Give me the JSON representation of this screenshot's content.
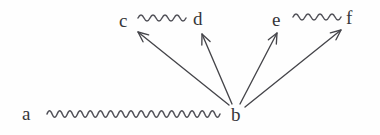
{
  "figure": {
    "type": "directed-graph-diagram",
    "width": 380,
    "height": 135,
    "background_color": "#fefefe",
    "ink_color": "#45454a",
    "label_color": "#36363a"
  },
  "nodes": [
    {
      "id": "a",
      "label": "a",
      "x": 22,
      "y": 104
    },
    {
      "id": "b",
      "label": "b",
      "x": 231,
      "y": 105
    },
    {
      "id": "c",
      "label": "c",
      "x": 119,
      "y": 11
    },
    {
      "id": "d",
      "label": "d",
      "x": 193,
      "y": 9
    },
    {
      "id": "e",
      "label": "e",
      "x": 272,
      "y": 10
    },
    {
      "id": "f",
      "label": "f",
      "x": 346,
      "y": 8
    }
  ],
  "squiggly_edges": [
    {
      "id": "a-b",
      "from": "a",
      "to": "b",
      "style": "squiggle",
      "x1": 47,
      "y1": 114,
      "x2": 220,
      "y2": 114,
      "waves": 17,
      "amplitude": 3.2
    },
    {
      "id": "c-d",
      "from": "c",
      "to": "d",
      "style": "squiggle",
      "x1": 138,
      "y1": 18,
      "x2": 186,
      "y2": 18,
      "waves": 4,
      "amplitude": 3.0
    },
    {
      "id": "e-f",
      "from": "e",
      "to": "f",
      "style": "squiggle",
      "x1": 293,
      "y1": 17,
      "x2": 341,
      "y2": 17,
      "waves": 4,
      "amplitude": 3.0
    }
  ],
  "arrows": [
    {
      "id": "b-to-c",
      "from": "b",
      "to": "c",
      "x1": 229,
      "y1": 105,
      "x2": 138,
      "y2": 32
    },
    {
      "id": "b-to-d",
      "from": "b",
      "to": "d",
      "x1": 232,
      "y1": 104,
      "x2": 202,
      "y2": 34
    },
    {
      "id": "b-to-e",
      "from": "b",
      "to": "e",
      "x1": 240,
      "y1": 104,
      "x2": 277,
      "y2": 33
    },
    {
      "id": "b-to-f",
      "from": "b",
      "to": "f",
      "x1": 245,
      "y1": 107,
      "x2": 341,
      "y2": 30
    }
  ]
}
